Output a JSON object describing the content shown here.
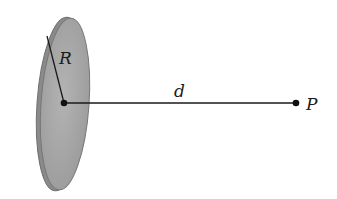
{
  "diagram": {
    "labels": {
      "radius": "R",
      "distance": "d",
      "point": "P"
    },
    "colors": {
      "disk_fill": "#a9a9a9",
      "disk_edge": "#6e6e6e",
      "line": "#1a1a1a",
      "background": "#ffffff"
    }
  }
}
